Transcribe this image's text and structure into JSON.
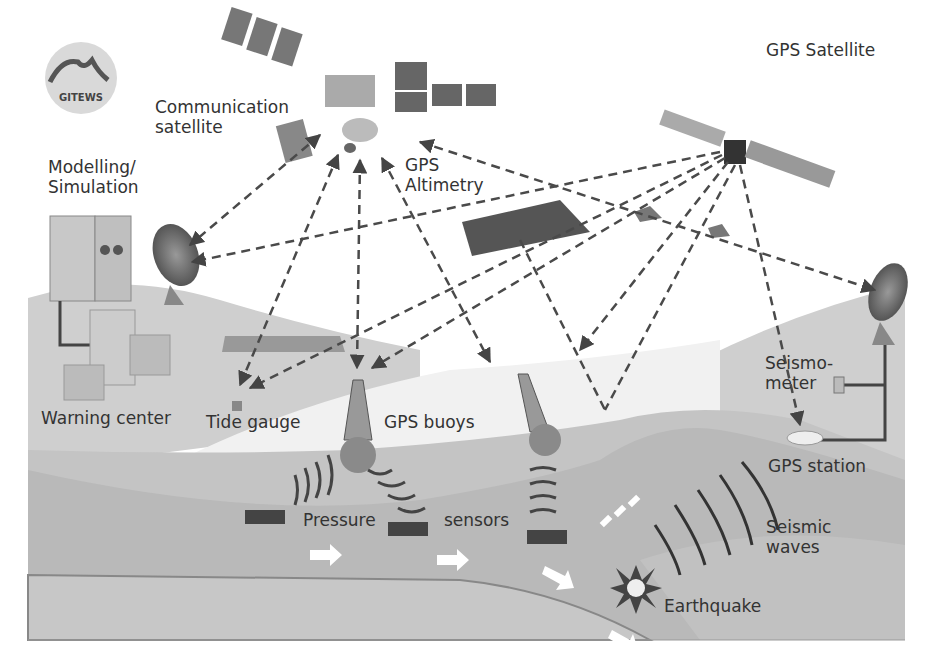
{
  "diagram": {
    "logo": {
      "text": "GITEWS"
    },
    "labels": {
      "communication_satellite": "Communication\nsatellite",
      "gps_satellite": "GPS Satellite",
      "modelling_simulation": "Modelling/\nSimulation",
      "gps_altimetry": "GPS\nAltimetry",
      "warning_center": "Warning center",
      "tide_gauge": "Tide gauge",
      "gps_buoys": "GPS buoys",
      "seismometer": "Seismo-\nmeter",
      "gps_station": "GPS station",
      "pressure": "Pressure",
      "sensors": "sensors",
      "seismic_waves": "Seismic\nwaves",
      "earthquake": "Earthquake"
    },
    "colors": {
      "background": "#ffffff",
      "land_light": "#d6d6d6",
      "sea": "#e8e8e8",
      "seafloor": "#bdbdbd",
      "crust": "#c8c8c8",
      "text": "#333333",
      "arrow": "#4a4a4a"
    }
  }
}
